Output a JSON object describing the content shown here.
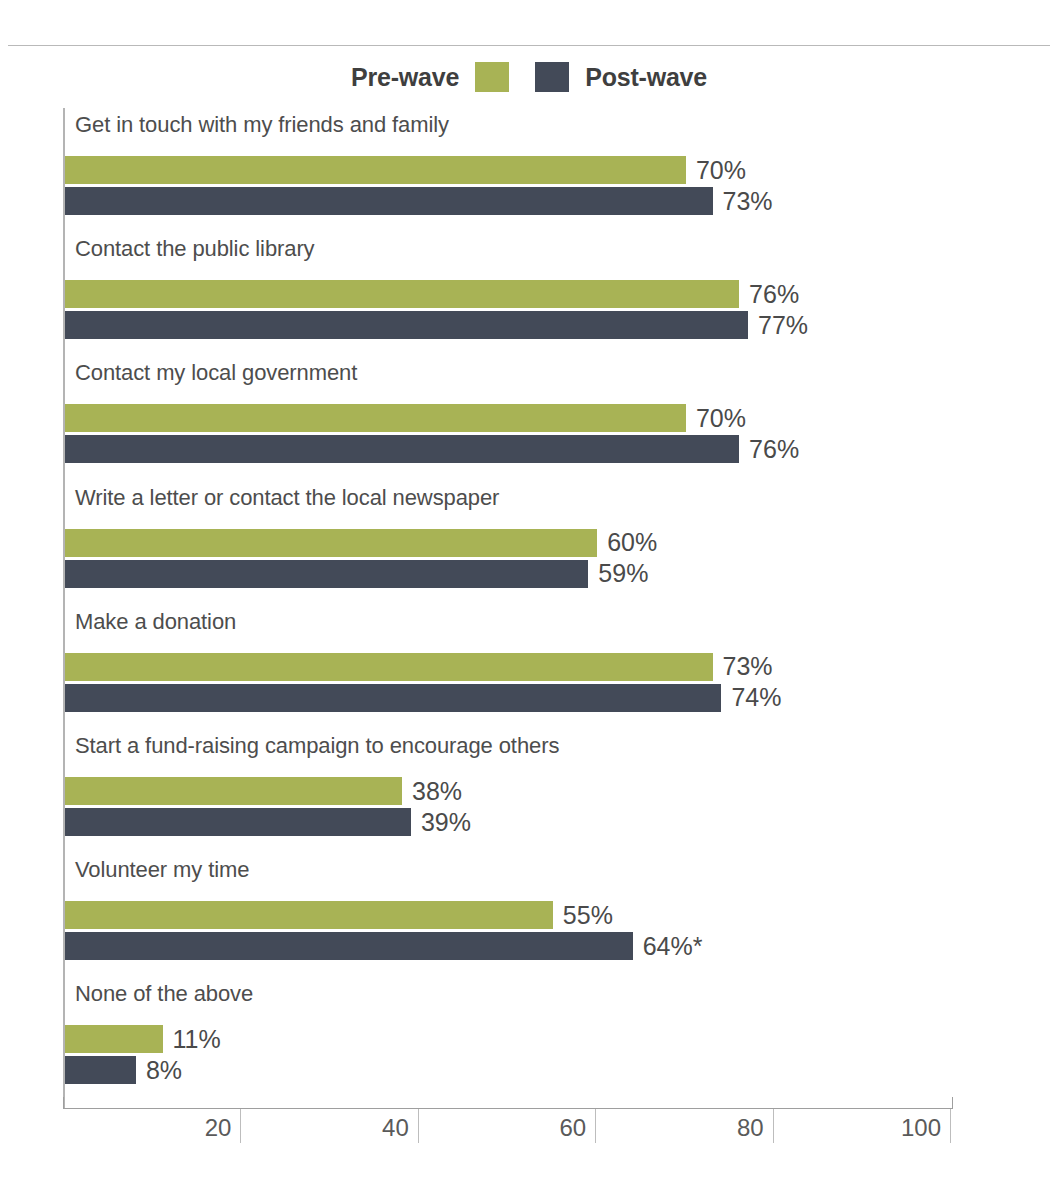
{
  "legend": {
    "entries": [
      {
        "label": "Pre-wave",
        "color": "#a8b355",
        "icon": "legend-swatch-icon"
      },
      {
        "label": "Post-wave",
        "color": "#434a58",
        "icon": "legend-swatch-icon"
      }
    ]
  },
  "axis": {
    "ticks": [
      "20",
      "40",
      "60",
      "80",
      "100"
    ],
    "tick_values": [
      20,
      40,
      60,
      80,
      100
    ],
    "min": 0,
    "max": 100
  },
  "chart_data": {
    "type": "bar",
    "orientation": "horizontal",
    "title": "",
    "subtitle": "",
    "xlabel": "",
    "ylabel": "",
    "xlim": [
      0,
      100
    ],
    "grid": false,
    "legend_position": "top-center",
    "categories": [
      "Get in touch with my friends and family",
      "Contact the public library",
      "Contact my local government",
      "Write a letter or contact the local newspaper",
      "Make a donation",
      "Start a fund-raising campaign to encourage others",
      "Volunteer my time",
      "None of the above"
    ],
    "series": [
      {
        "name": "Pre-wave",
        "color": "#a8b355",
        "values": [
          70,
          76,
          70,
          60,
          73,
          38,
          55,
          11
        ],
        "labels": [
          "70%",
          "76%",
          "70%",
          "60%",
          "73%",
          "38%",
          "55%",
          "11%"
        ]
      },
      {
        "name": "Post-wave",
        "color": "#434a58",
        "values": [
          73,
          77,
          76,
          59,
          74,
          39,
          64,
          8
        ],
        "labels": [
          "73%",
          "77%",
          "76%",
          "59%",
          "74%",
          "39%",
          "64%*",
          "8%"
        ]
      }
    ],
    "annotations": [
      "* denotes statistically significant change"
    ],
    "tick_labels": [
      "20",
      "40",
      "60",
      "80",
      "100"
    ]
  }
}
